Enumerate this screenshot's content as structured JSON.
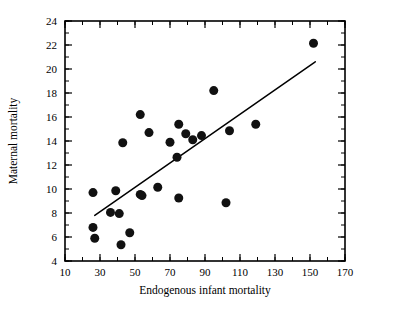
{
  "chart_data": {
    "type": "scatter",
    "title": "",
    "xlabel": "Endogenous infant mortality",
    "ylabel": "Maternal mortality",
    "xlim": [
      10,
      170
    ],
    "ylim": [
      4,
      24
    ],
    "x_ticks": [
      10,
      30,
      50,
      70,
      90,
      110,
      130,
      150,
      170
    ],
    "y_ticks": [
      4,
      6,
      8,
      10,
      12,
      14,
      16,
      18,
      20,
      22,
      24
    ],
    "x_tick_labels": [
      "10",
      "30",
      "50",
      "70",
      "90",
      "110",
      "130",
      "150",
      "170"
    ],
    "y_tick_labels": [
      "4",
      "6",
      "8",
      "10",
      "12",
      "14",
      "16",
      "18",
      "20",
      "22",
      "24"
    ],
    "x_minor_step": 10,
    "y_minor_step": 1,
    "grid": false,
    "legend": null,
    "marker": {
      "shape": "circle",
      "color": "#111111",
      "size_px": 9
    },
    "points": [
      {
        "x": 26,
        "y": 9.7
      },
      {
        "x": 26,
        "y": 6.8
      },
      {
        "x": 27,
        "y": 5.9
      },
      {
        "x": 36,
        "y": 8.05
      },
      {
        "x": 39,
        "y": 9.85
      },
      {
        "x": 41,
        "y": 7.95
      },
      {
        "x": 42,
        "y": 5.35
      },
      {
        "x": 43,
        "y": 13.85
      },
      {
        "x": 47,
        "y": 6.35
      },
      {
        "x": 53,
        "y": 16.2
      },
      {
        "x": 53,
        "y": 9.55
      },
      {
        "x": 54,
        "y": 9.45
      },
      {
        "x": 58,
        "y": 14.7
      },
      {
        "x": 63,
        "y": 10.15
      },
      {
        "x": 70,
        "y": 13.9
      },
      {
        "x": 74,
        "y": 12.65
      },
      {
        "x": 75,
        "y": 15.4
      },
      {
        "x": 75,
        "y": 9.25
      },
      {
        "x": 79,
        "y": 14.6
      },
      {
        "x": 83,
        "y": 14.1
      },
      {
        "x": 88,
        "y": 14.45
      },
      {
        "x": 95,
        "y": 18.2
      },
      {
        "x": 102,
        "y": 8.85
      },
      {
        "x": 104,
        "y": 14.85
      },
      {
        "x": 119,
        "y": 15.4
      },
      {
        "x": 152,
        "y": 22.15
      }
    ],
    "fit_line": {
      "type": "linear-regression",
      "x_start": 27,
      "y_start": 7.8,
      "x_end": 153,
      "y_end": 20.6
    }
  },
  "figure": {
    "background": "#ffffff",
    "axis_color": "#000000"
  }
}
